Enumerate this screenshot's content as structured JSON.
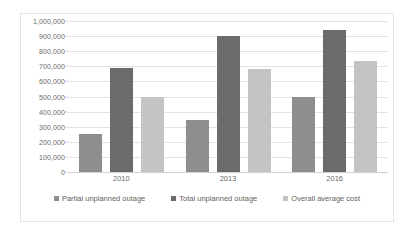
{
  "chart_data": {
    "type": "bar",
    "title": "",
    "subtitle": "",
    "xlabel": "",
    "ylabel": "",
    "categories": [
      "2010",
      "2013",
      "2016"
    ],
    "series": [
      {
        "name": "Partial unplanned outage",
        "values": [
          250000,
          345000,
          495000
        ],
        "color": "#8c8e90"
      },
      {
        "name": "Total unplanned outage",
        "values": [
          690000,
          900000,
          940000
        ],
        "color": "#6a6b6d"
      },
      {
        "name": "Overall average cost",
        "values": [
          500000,
          685000,
          735000
        ],
        "color": "#c3c4c6"
      }
    ],
    "ylim": [
      0,
      1000000
    ],
    "ytick_values": [
      0,
      100000,
      200000,
      300000,
      400000,
      500000,
      600000,
      700000,
      800000,
      900000,
      1000000
    ],
    "ytick_labels": [
      "0",
      "100,000",
      "200,000",
      "300,000",
      "400,000",
      "500,000",
      "600,000",
      "700,000",
      "800,000",
      "900,000",
      "1,000,000"
    ],
    "grid": true,
    "grid_axis": "y",
    "legend_position": "bottom",
    "orientation": "vertical",
    "group_mode": "clustered"
  },
  "colors": {
    "background": "#ffffff",
    "border": "#e4e4e6",
    "gridline": "#e2e2e4",
    "axis_text": "#6a6a6a",
    "legend_text": "#5f5f5f",
    "series_1": "#8c8e90",
    "series_2": "#6a6b6d",
    "series_3": "#c3c4c6"
  }
}
